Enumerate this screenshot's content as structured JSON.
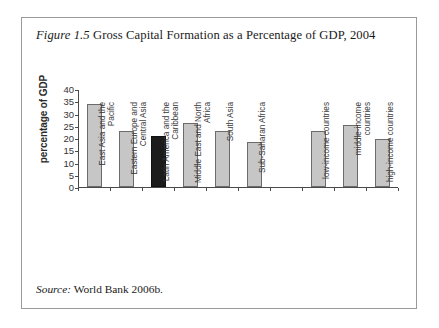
{
  "caption": {
    "figure_label": "Figure 1.5",
    "title": "Gross Capital Formation as a Percentage of GDP, 2004"
  },
  "source": {
    "label": "Source:",
    "text": "World Bank 2006b."
  },
  "chart_data": {
    "type": "bar",
    "title": "Gross Capital Formation as a Percentage of GDP, 2004",
    "xlabel": "",
    "ylabel": "percentage of GDP",
    "ylim": [
      0,
      40
    ],
    "yticks": [
      40,
      35,
      30,
      25,
      20,
      15,
      10,
      5,
      0
    ],
    "grid": false,
    "legend": "none",
    "highlight_color": "#1c1c1c",
    "bar_color": "#c6c6c6",
    "categories": [
      "East Asia and the Pacific",
      "Eastern Europe and Central Asia",
      "Latin America and the Caribbean",
      "Middle East and North Africa",
      "South Asia",
      "Sub-Saharan Africa",
      "",
      "low-income countries",
      "middle-income countries",
      "high-income countries"
    ],
    "values": [
      34,
      23,
      21,
      26,
      23,
      18.5,
      null,
      23,
      25.5,
      19.5
    ],
    "highlighted": [
      "Latin America and the Caribbean"
    ]
  }
}
